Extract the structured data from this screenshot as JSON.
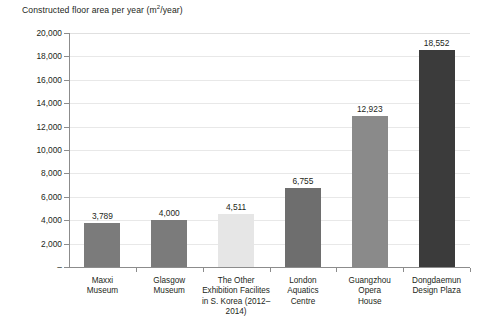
{
  "chart_data": {
    "type": "bar",
    "title_main": "Constructed floor area per year (m",
    "title_sup": "2",
    "title_tail": "/year)",
    "xlabel": "",
    "ylabel": "",
    "ylim": [
      0,
      20000
    ],
    "grid": true,
    "legend": "none",
    "categories": [
      "Maxxi Museum",
      "Glasgow Museum",
      "The Other Exhibition Facilites in S. Korea (2012–2014)",
      "London Aquatics Centre",
      "Guangzhou Opera House",
      "Dongdaemun Design Plaza"
    ],
    "category_lines": [
      [
        "Maxxi",
        "Museum"
      ],
      [
        "Glasgow",
        "Museum"
      ],
      [
        "The Other",
        "Exhibition Facilites",
        "in S. Korea (2012–",
        "2014)"
      ],
      [
        "London",
        "Aquatics",
        "Centre"
      ],
      [
        "Guangzhou",
        "Opera",
        "House"
      ],
      [
        "Dongdaemun",
        "Design Plaza"
      ]
    ],
    "values": [
      3789,
      4000,
      4511,
      6755,
      12923,
      18552
    ],
    "value_labels": [
      "3,789",
      "4,000",
      "4,511",
      "6,755",
      "12,923",
      "18,552"
    ],
    "bar_colors": [
      "#7b7b7b",
      "#7b7b7b",
      "#e6e6e6",
      "#6e6e6e",
      "#8a8a8a",
      "#3b3b3b"
    ],
    "y_ticks": [
      20000,
      18000,
      16000,
      14000,
      12000,
      10000,
      8000,
      6000,
      4000,
      2000,
      0
    ],
    "y_tick_labels": [
      "20,000",
      "18,000",
      "16,000",
      "14,000",
      "12,000",
      "10,000",
      "8,000",
      "6,000",
      "4,000",
      "2,000",
      "–"
    ]
  },
  "colors": {
    "background": "#ffffff",
    "gridline": "#e8e8e8",
    "axis": "#8c8c8c",
    "text": "#231f20"
  }
}
